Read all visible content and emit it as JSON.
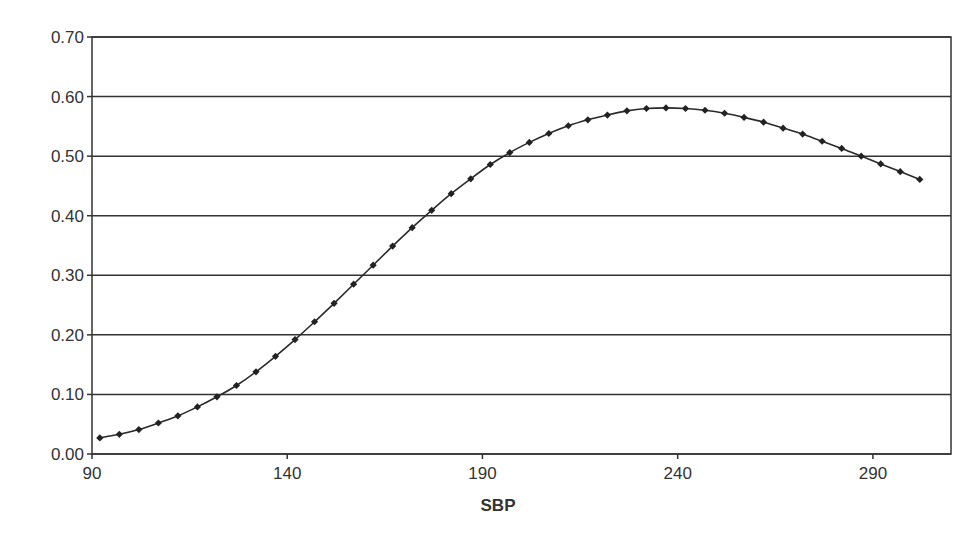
{
  "chart_data": {
    "type": "line",
    "title": "",
    "xlabel": "SBP",
    "ylabel": "",
    "xlim": [
      90,
      310
    ],
    "ylim": [
      0.0,
      0.7
    ],
    "x_ticks": [
      90,
      140,
      190,
      240,
      290
    ],
    "y_ticks": [
      "0.00",
      "0.10",
      "0.20",
      "0.30",
      "0.40",
      "0.50",
      "0.60",
      "0.70"
    ],
    "grid": "horizontal",
    "legend": null,
    "marker": "diamond",
    "series": [
      {
        "name": "SBP curve",
        "x": [
          92,
          97,
          102,
          107,
          112,
          117,
          122,
          127,
          132,
          137,
          142,
          147,
          152,
          157,
          162,
          167,
          172,
          177,
          182,
          187,
          192,
          197,
          202,
          207,
          212,
          217,
          222,
          227,
          232,
          237,
          242,
          247,
          252,
          257,
          262,
          267,
          272,
          277,
          282,
          287,
          292,
          297,
          302
        ],
        "values": [
          0.027,
          0.033,
          0.041,
          0.052,
          0.064,
          0.079,
          0.096,
          0.115,
          0.138,
          0.164,
          0.192,
          0.222,
          0.253,
          0.285,
          0.317,
          0.349,
          0.38,
          0.409,
          0.437,
          0.462,
          0.486,
          0.506,
          0.523,
          0.538,
          0.551,
          0.561,
          0.569,
          0.576,
          0.58,
          0.581,
          0.58,
          0.577,
          0.572,
          0.565,
          0.557,
          0.547,
          0.537,
          0.525,
          0.513,
          0.5,
          0.487,
          0.474,
          0.461
        ]
      }
    ]
  },
  "axes": {
    "x_tick_labels": [
      "90",
      "140",
      "190",
      "240",
      "290"
    ],
    "y_tick_labels": [
      "0.00",
      "0.10",
      "0.20",
      "0.30",
      "0.40",
      "0.50",
      "0.60",
      "0.70"
    ],
    "x_title": "SBP"
  }
}
